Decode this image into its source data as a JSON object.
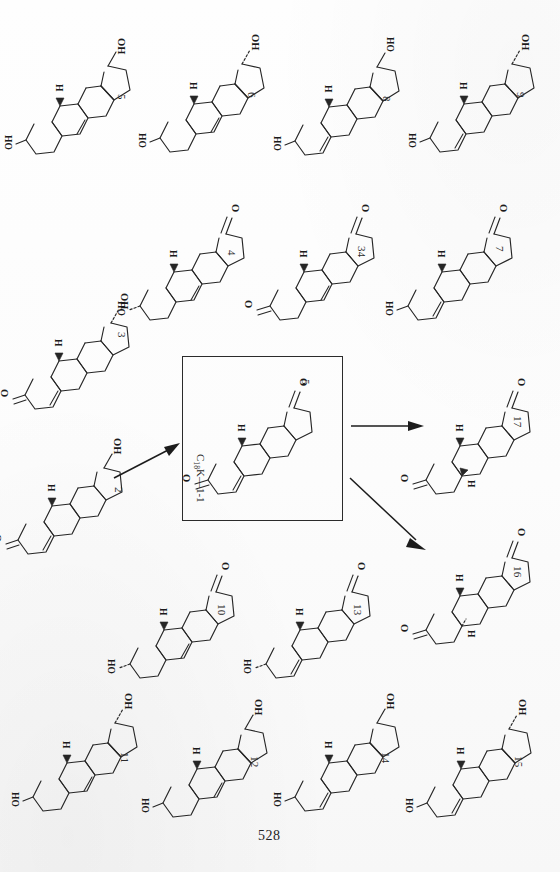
{
  "document": {
    "page_number": "528",
    "orientation_note": "page content rotated 90 degrees",
    "background_color": "#fdfdfd",
    "ink_color": "#262626"
  },
  "scheme_box": {
    "formula_label": "C18K—1-1",
    "formula_prefix": "C",
    "formula_sub": "18",
    "formula_suffix": "K—1-1",
    "compound_number": "5",
    "border_color": "#2b2b2b"
  },
  "arrows": [
    {
      "name": "arrow-into-box",
      "label": "",
      "direction": "up-right"
    },
    {
      "name": "arrow-to-17",
      "label": "",
      "direction": "right"
    },
    {
      "name": "arrow-to-16",
      "label": "",
      "direction": "down-right"
    }
  ],
  "atom_labels": {
    "hydroxyl": "OH",
    "hydroxyl_rev": "HO",
    "oxygen": "O",
    "hydrogen": "H"
  },
  "structures": [
    {
      "id": "5",
      "number": "5",
      "name": "17-hydroxy-3-hydroxy-androstadiene",
      "top_label": "OH",
      "bottom_label": "HO",
      "has_h": true,
      "ketone": false,
      "ring_ene": "5-ene",
      "stereo_oh": "plain"
    },
    {
      "id": "6",
      "number": "6",
      "name": "17-hydroxy-3-hydroxy-androstadiene epimer",
      "top_label": "OH",
      "bottom_label": "HO",
      "has_h": true,
      "ketone": false,
      "ring_ene": "5-ene",
      "stereo_oh": "hash"
    },
    {
      "id": "8",
      "number": "8",
      "name": "17-hydroxy-3-hydroxy-androstene",
      "top_label": "HO",
      "bottom_label": "HO",
      "has_h": true,
      "ketone": false,
      "ring_ene": "4-ene",
      "stereo_oh": "plain"
    },
    {
      "id": "9",
      "number": "9",
      "name": "17-hydroxy-3-hydroxy-androstene epimer",
      "top_label": "OH",
      "bottom_label": "HO",
      "has_h": true,
      "ketone": false,
      "ring_ene": "4-ene",
      "stereo_oh": "hash"
    },
    {
      "id": "4",
      "number": "4",
      "name": "17-keto-3-hydroxy-androstene",
      "top_label": "O",
      "bottom_label": "HO",
      "has_h": true,
      "ketone": true,
      "ring_ene": "5-ene",
      "stereo_oh": "hash"
    },
    {
      "id": "34",
      "number": "34",
      "name": "17-keto-3-keto-androstene",
      "top_label": "O",
      "bottom_label": "O",
      "has_h": true,
      "ketone": true,
      "ring_ene": "5-ene",
      "stereo_oh": "none"
    },
    {
      "id": "7",
      "number": "7",
      "name": "17-keto-3-hydroxy-androstene",
      "top_label": "O",
      "bottom_label": "HO",
      "has_h": true,
      "ketone": true,
      "ring_ene": "4-ene",
      "stereo_oh": "plain"
    },
    {
      "id": "3",
      "number": "3",
      "name": "17-hydroxy-3-keto-androstene (testosterone)",
      "top_label": "OH",
      "bottom_label": "O",
      "has_h": true,
      "ketone": false,
      "ring_ene": "4-ene",
      "stereo_oh": "hash"
    },
    {
      "id": "2",
      "number": "2",
      "name": "17-hydroxy-3-keto-androstene",
      "top_label": "OH",
      "bottom_label": "O",
      "has_h": true,
      "ketone": false,
      "ring_ene": "4-ene",
      "stereo_oh": "plain"
    },
    {
      "id": "10",
      "number": "10",
      "name": "17-keto-3-hydroxy-androstene",
      "top_label": "O",
      "bottom_label": "HO",
      "has_h": true,
      "ketone": true,
      "ring_ene": "5-ene",
      "stereo_oh": "hash"
    },
    {
      "id": "13",
      "number": "13",
      "name": "17-keto-3-hydroxy-androstene",
      "top_label": "O",
      "bottom_label": "HO",
      "has_h": true,
      "ketone": true,
      "ring_ene": "4-ene",
      "stereo_oh": "hash"
    },
    {
      "id": "11",
      "number": "11",
      "name": "17-hydroxy-3-hydroxy-androstene",
      "top_label": "OH",
      "bottom_label": "HO",
      "has_h": true,
      "ketone": false,
      "ring_ene": "5-ene",
      "stereo_oh": "hash"
    },
    {
      "id": "12",
      "number": "12",
      "name": "17-hydroxy-3-hydroxy-androstene",
      "top_label": "OH",
      "bottom_label": "HO",
      "has_h": true,
      "ketone": false,
      "ring_ene": "5-ene",
      "stereo_oh": "plain"
    },
    {
      "id": "14",
      "number": "14",
      "name": "17-hydroxy-3-hydroxy-androstene",
      "top_label": "OH",
      "bottom_label": "HO",
      "has_h": true,
      "ketone": false,
      "ring_ene": "4-ene",
      "stereo_oh": "plain"
    },
    {
      "id": "15",
      "number": "15",
      "name": "17-hydroxy-3-hydroxy-androstene epimer",
      "top_label": "OH",
      "bottom_label": "HO",
      "has_h": true,
      "ketone": false,
      "ring_ene": "4-ene",
      "stereo_oh": "hash"
    },
    {
      "id": "17",
      "number": "17",
      "name": "17-keto-3-keto-androstane (5-alpha)",
      "top_label": "O",
      "bottom_label": "O",
      "has_h": true,
      "has_h2": true,
      "ketone": true,
      "ring_ene": "none",
      "stereo_oh": "none"
    },
    {
      "id": "16",
      "number": "16",
      "name": "17-keto-3-keto-androstane (5-beta)",
      "top_label": "O",
      "bottom_label": "O",
      "has_h": true,
      "has_h2": true,
      "ketone": true,
      "ring_ene": "none",
      "stereo_oh": "none"
    },
    {
      "id": "boxed",
      "number": "5",
      "name": "boxed central compound",
      "top_label": "O",
      "bottom_label": "O",
      "has_h": true,
      "ketone": true,
      "ring_ene": "4-ene",
      "stereo_oh": "none"
    }
  ]
}
